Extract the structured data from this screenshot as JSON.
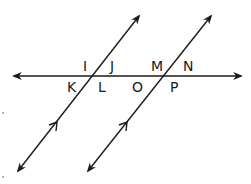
{
  "diagram": {
    "line_color": "#1a1a1a",
    "background": "#ffffff",
    "horizontal_line": {
      "name": "transversal",
      "arrows": "both"
    },
    "parallel_lines": [
      {
        "name": "left-parallel-line",
        "arrows": "both",
        "parallel_mark": "single-chevron"
      },
      {
        "name": "right-parallel-line",
        "arrows": "both",
        "parallel_mark": "single-chevron"
      }
    ],
    "angle_labels": {
      "I": "I",
      "J": "J",
      "K": "K",
      "L": "L",
      "M": "M",
      "N": "N",
      "O": "O",
      "P": "P"
    }
  }
}
